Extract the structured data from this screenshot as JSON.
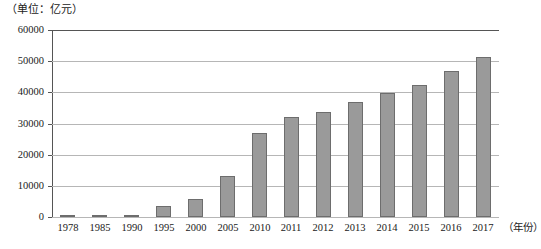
{
  "chart_data": {
    "type": "bar",
    "title": "",
    "unit_caption": "（单位：亿元）",
    "xlabel": "（年份）",
    "ylabel": "",
    "ylim": [
      0,
      60000
    ],
    "ytick_step": 10000,
    "yticks": [
      "60000",
      "50000",
      "40000",
      "30000",
      "20000",
      "10000",
      "0"
    ],
    "grid": true,
    "legend": "none",
    "bar_color": "#9a9a9a",
    "bar_border_color": "#6d6d6d",
    "gridline_color": "#b6b6b6",
    "axis_color": "#555555",
    "categories": [
      "1978",
      "1985",
      "1990",
      "1995",
      "2000",
      "2005",
      "2010",
      "2011",
      "2012",
      "2013",
      "2014",
      "2015",
      "2016",
      "2017"
    ],
    "values": [
      100,
      260,
      700,
      3400,
      5800,
      13100,
      27100,
      32000,
      33700,
      36800,
      39900,
      42400,
      46700,
      51200
    ]
  }
}
